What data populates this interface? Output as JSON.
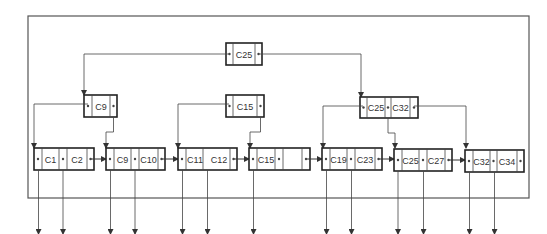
{
  "diagram": {
    "type": "B+ tree index",
    "colors": {
      "line": "#444444",
      "frame": "#555555",
      "background": "#ffffff"
    },
    "root": {
      "id": "root",
      "keys": [
        "C25"
      ]
    },
    "internal_nodes": [
      {
        "id": "n-c9",
        "keys": [
          "C9"
        ]
      },
      {
        "id": "n-c15",
        "keys": [
          "C15"
        ]
      },
      {
        "id": "n-c25-c32",
        "keys": [
          "C25",
          "C32"
        ]
      }
    ],
    "leaf_nodes": [
      {
        "id": "leaf-1",
        "keys": [
          "C1",
          "C2"
        ]
      },
      {
        "id": "leaf-2",
        "keys": [
          "C9",
          "C10"
        ]
      },
      {
        "id": "leaf-3",
        "keys": [
          "C11",
          "C12"
        ]
      },
      {
        "id": "leaf-4",
        "keys": [
          "C15",
          ""
        ]
      },
      {
        "id": "leaf-5",
        "keys": [
          "C19",
          "C23"
        ]
      },
      {
        "id": "leaf-6",
        "keys": [
          "C25",
          "C27"
        ]
      },
      {
        "id": "leaf-7",
        "keys": [
          "C32",
          "C34"
        ]
      }
    ],
    "pointer_symbol": "•"
  }
}
